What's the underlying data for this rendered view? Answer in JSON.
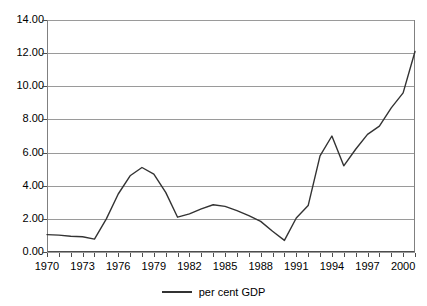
{
  "chart_data": {
    "type": "line",
    "title": "",
    "xlabel": "",
    "ylabel": "",
    "xlim": [
      1970,
      2001
    ],
    "ylim": [
      0,
      14
    ],
    "grid": true,
    "legend_position": "bottom-center",
    "y_ticks": [
      "0.00",
      "2.00",
      "4.00",
      "6.00",
      "8.00",
      "10.00",
      "12.00",
      "14.00"
    ],
    "y_tick_values": [
      0,
      2,
      4,
      6,
      8,
      10,
      12,
      14
    ],
    "x_tick_labels": [
      "1970",
      "1973",
      "1976",
      "1979",
      "1982",
      "1985",
      "1988",
      "1991",
      "1994",
      "1997",
      "2000"
    ],
    "x_tick_label_values": [
      1970,
      1973,
      1976,
      1979,
      1982,
      1985,
      1988,
      1991,
      1994,
      1997,
      2000
    ],
    "x": [
      1970,
      1971,
      1972,
      1973,
      1974,
      1975,
      1976,
      1977,
      1978,
      1979,
      1980,
      1981,
      1982,
      1983,
      1984,
      1985,
      1986,
      1987,
      1988,
      1989,
      1990,
      1991,
      1992,
      1993,
      1994,
      1995,
      1996,
      1997,
      1998,
      1999,
      2000,
      2001
    ],
    "series": [
      {
        "name": "per cent GDP",
        "color": "#333333",
        "values": [
          1.05,
          1.02,
          0.95,
          0.92,
          0.78,
          2.0,
          3.5,
          4.6,
          5.1,
          4.7,
          3.6,
          2.1,
          2.3,
          2.6,
          2.85,
          2.75,
          2.5,
          2.2,
          1.85,
          1.25,
          0.7,
          2.05,
          2.8,
          5.8,
          7.0,
          5.2,
          6.2,
          7.1,
          7.6,
          8.7,
          9.6,
          12.1
        ]
      }
    ],
    "legend": [
      {
        "label": "per cent GDP",
        "color": "#333333",
        "marker": "line"
      }
    ]
  }
}
